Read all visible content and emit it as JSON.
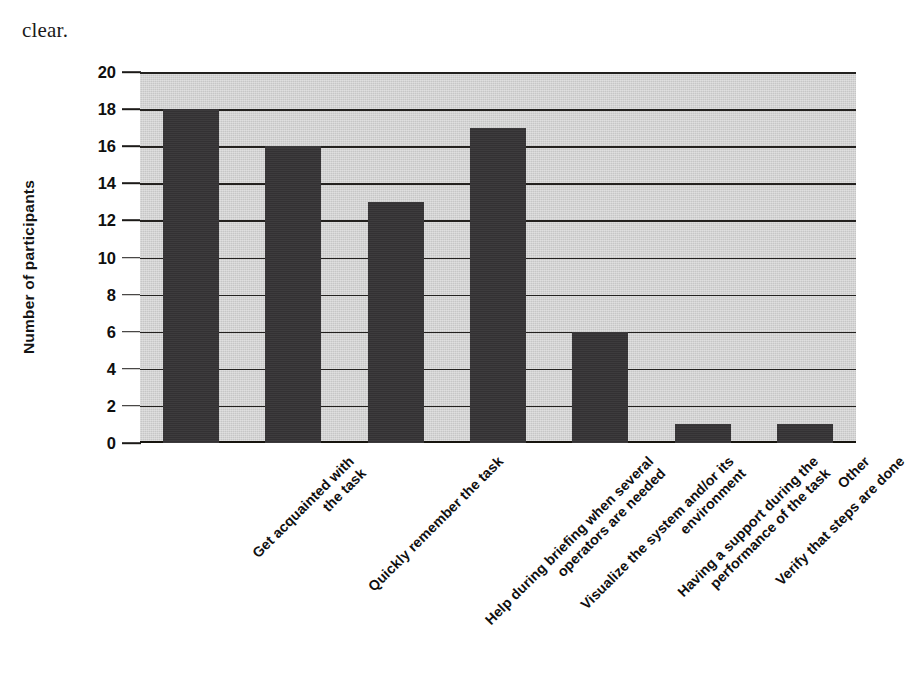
{
  "page": {
    "running_text": "clear."
  },
  "chart_data": {
    "type": "bar",
    "title": "",
    "xlabel": "",
    "ylabel": "Number of participants",
    "ylim": [
      0,
      20
    ],
    "ytick_step": 2,
    "yticks": [
      20,
      18,
      16,
      14,
      12,
      10,
      8,
      6,
      4,
      2,
      0
    ],
    "grid": true,
    "legend": "none",
    "bar_color": "#333133",
    "plot_background": "#c6c6c6",
    "categories": [
      "Get acquainted with the task",
      "Quickly remember the task",
      "Help during briefing when several operators are needed",
      "Visualize the system and/or its environment",
      "Having a support during the performance of the task",
      "Verify that steps are done",
      "Other"
    ],
    "category_lines": [
      [
        "Get acquainted with",
        "the task"
      ],
      [
        "Quickly remember the task"
      ],
      [
        "Help during briefing when several",
        "operators are needed"
      ],
      [
        "Visualize the system and/or its",
        "environment"
      ],
      [
        "Having a support during the",
        "performance of the task"
      ],
      [
        "Verify that steps are done"
      ],
      [
        "Other"
      ]
    ],
    "values": [
      18,
      16,
      13,
      17,
      6,
      1,
      1
    ]
  }
}
